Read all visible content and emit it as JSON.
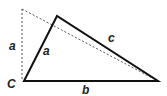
{
  "diagram": {
    "title": "",
    "colors": {
      "line": "#111111",
      "dashed": "#555555",
      "label": "#222222",
      "background": "#ffffff"
    },
    "points": {
      "C": [
        24,
        81
      ],
      "apex": [
        57,
        16
      ],
      "right": [
        158,
        81
      ],
      "dashed_top": [
        22,
        9
      ]
    },
    "labels": {
      "vertex_C": "C",
      "side_a_solid": "a",
      "side_a_dashed": "a",
      "side_b": "b",
      "side_c": "c"
    }
  }
}
